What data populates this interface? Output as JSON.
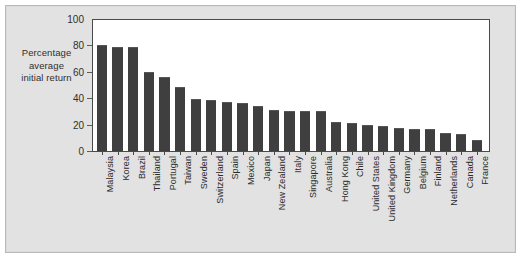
{
  "chart_data": {
    "type": "bar",
    "title": "",
    "xlabel": "",
    "ylabel": "Percentage average initial return",
    "ylabel_lines": [
      "Percentage",
      "average",
      "initial return"
    ],
    "ylim": [
      0,
      100
    ],
    "yticks": [
      0,
      20,
      40,
      60,
      80,
      100
    ],
    "ytick_labels": [
      "0",
      "20",
      "40",
      "60",
      "80",
      "100"
    ],
    "grid": false,
    "legend": null,
    "bar_color": "#3f3f3f",
    "plot_background": "#ffffff",
    "panel_background": "#e2e2e2",
    "categories": [
      "Malaysia",
      "Korea",
      "Brazil",
      "Thailand",
      "Portugal",
      "Taiwan",
      "Sweden",
      "Switzerland",
      "Spain",
      "Mexico",
      "Japan",
      "New Zealand",
      "Italy",
      "Singapore",
      "Australia",
      "Hong Kong",
      "Chile",
      "United States",
      "United Kingdom",
      "Germany",
      "Belgium",
      "Finland",
      "Netherlands",
      "Canada",
      "France"
    ],
    "values": [
      80,
      78.5,
      78.5,
      60,
      56,
      48.5,
      39.5,
      39,
      37,
      36,
      34,
      31,
      30.5,
      30.5,
      30.5,
      22,
      21,
      20,
      19,
      17.5,
      17,
      16.5,
      14,
      13,
      8
    ]
  }
}
